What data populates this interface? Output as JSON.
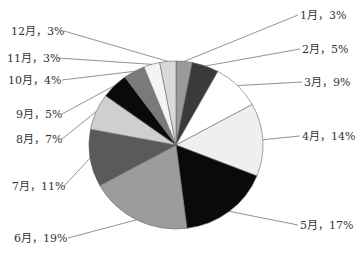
{
  "chart_data": {
    "type": "pie",
    "title": "",
    "start_angle": "12 o'clock",
    "direction": "clockwise",
    "categories": [
      "1月",
      "2月",
      "3月",
      "4月",
      "5月",
      "6月",
      "7月",
      "8月",
      "9月",
      "10月",
      "11月",
      "12月"
    ],
    "values": [
      3,
      5,
      9,
      14,
      17,
      19,
      11,
      7,
      5,
      4,
      3,
      3
    ],
    "unit": "%",
    "labels": [
      "1月，3%",
      "2月，5%",
      "3月，9%",
      "4月，14%",
      "5月，17%",
      "6月，19%",
      "7月，11%",
      "8月，7%",
      "9月，5%",
      "10月，4%",
      "11月，3%",
      "12月，3%"
    ],
    "colors": [
      "#9a9a9a",
      "#3a3a3a",
      "#ffffff",
      "#efefef",
      "#0a0a0a",
      "#9c9c9c",
      "#5a5a5a",
      "#cfcfcf",
      "#0a0a0a",
      "#7a7a7a",
      "#f4f4f4",
      "#d9d9d9"
    ],
    "legend": "none (data labels with leader lines)"
  },
  "layout": {
    "center": [
      176,
      145
    ],
    "rx": 87,
    "ry": 84,
    "label_positions": [
      {
        "x": 300,
        "y": 19,
        "anchor": "start",
        "line_end": [
          298,
          15
        ]
      },
      {
        "x": 302,
        "y": 53,
        "anchor": "start",
        "line_end": [
          300,
          49
        ]
      },
      {
        "x": 304,
        "y": 86,
        "anchor": "start",
        "line_end": [
          302,
          82
        ]
      },
      {
        "x": 302,
        "y": 140,
        "anchor": "start",
        "line_end": [
          300,
          136
        ]
      },
      {
        "x": 300,
        "y": 229,
        "anchor": "start",
        "line_end": [
          298,
          225
        ]
      },
      {
        "x": 14,
        "y": 242,
        "anchor": "start",
        "line_end": [
          68,
          238
        ]
      },
      {
        "x": 12,
        "y": 190,
        "anchor": "start",
        "line_end": [
          64,
          186
        ]
      },
      {
        "x": 16,
        "y": 143,
        "anchor": "start",
        "line_end": [
          62,
          139
        ]
      },
      {
        "x": 16,
        "y": 118,
        "anchor": "start",
        "line_end": [
          62,
          114
        ]
      },
      {
        "x": 8,
        "y": 84,
        "anchor": "start",
        "line_end": [
          62,
          80
        ]
      },
      {
        "x": 7,
        "y": 62,
        "anchor": "start",
        "line_end": [
          58,
          58
        ]
      },
      {
        "x": 11,
        "y": 35,
        "anchor": "start",
        "line_end": [
          64,
          31
        ]
      }
    ]
  }
}
